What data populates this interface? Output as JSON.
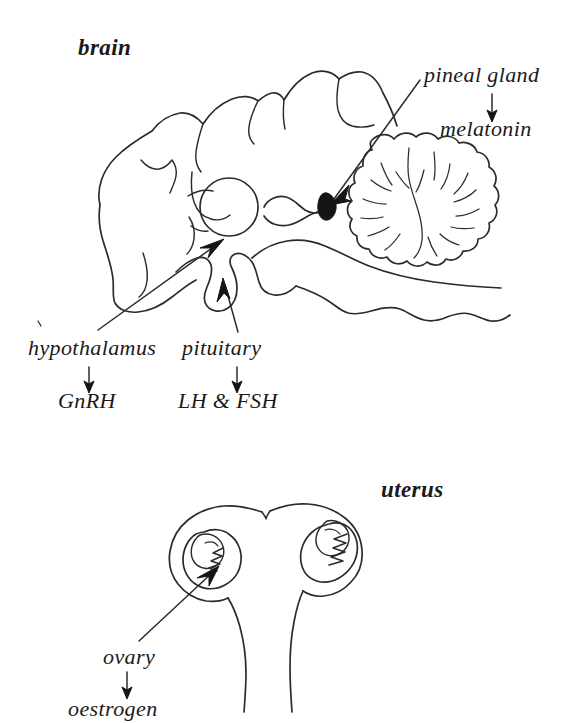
{
  "diagram": {
    "style": "black ink line art on white background",
    "ink_color": "#2b2b2b",
    "background_color": "#ffffff"
  },
  "panels": [
    {
      "id": "brain-panel",
      "heading": "brain",
      "structures": [
        "cerebrum",
        "cerebellum",
        "thalamus",
        "hypothalamus",
        "pituitary gland",
        "pineal gland",
        "brainstem"
      ]
    },
    {
      "id": "uterus-panel",
      "heading": "uterus",
      "structures": [
        "uterus body",
        "left ovary",
        "right ovary",
        "fallopian tubes"
      ]
    }
  ],
  "labels": {
    "brain": "brain",
    "pineal_gland": "pineal gland",
    "melatonin": "melatonin",
    "hypothalamus": "hypothalamus",
    "gnrh": "GnRH",
    "pituitary": "pituitary",
    "lh_fsh": "LH & FSH",
    "uterus": "uterus",
    "ovary": "ovary",
    "oestrogen": "oestrogen"
  },
  "hormone_arrows": [
    {
      "gland": "pineal gland",
      "hormone": "melatonin"
    },
    {
      "gland": "hypothalamus",
      "hormone": "GnRH"
    },
    {
      "gland": "pituitary",
      "hormone": "LH & FSH"
    },
    {
      "gland": "ovary",
      "hormone": "oestrogen"
    }
  ],
  "pointer_arrows": [
    {
      "from_label": "pineal gland",
      "to_structure": "pineal gland"
    },
    {
      "from_label": "hypothalamus",
      "to_structure": "hypothalamus"
    },
    {
      "from_label": "pituitary",
      "to_structure": "pituitary gland"
    },
    {
      "from_label": "ovary",
      "to_structure": "left ovary"
    }
  ]
}
